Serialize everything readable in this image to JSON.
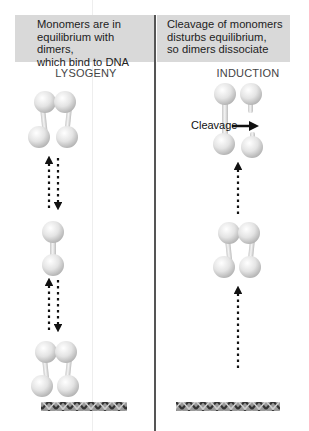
{
  "panels": {
    "left": {
      "description_lines": [
        "Monomers are in",
        "equilibrium with dimers,",
        "which bind to DNA"
      ],
      "title": "LYSOGENY"
    },
    "right": {
      "description_lines": [
        "Cleavage of monomers",
        "disturbs equilibrium,",
        "so dimers dissociate"
      ],
      "title": "INDUCTION",
      "cleavage_label": "Cleavage"
    }
  },
  "colors": {
    "header_bg": "#d9d9d9",
    "divider": "#555555",
    "sphere": "#e6e6e6",
    "arrow": "#111111"
  }
}
